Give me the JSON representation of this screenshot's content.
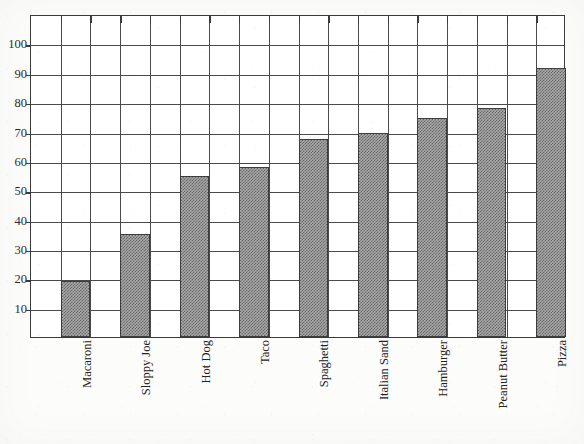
{
  "chart_data": {
    "type": "bar",
    "title": "",
    "xlabel": "",
    "ylabel": "",
    "ylim": [
      0,
      110
    ],
    "yticks": [
      10,
      20,
      30,
      40,
      50,
      60,
      70,
      80,
      90,
      100
    ],
    "ytick_labels": [
      "10",
      "20",
      "30",
      "40",
      "50",
      "60",
      "70",
      "80",
      "90",
      "100"
    ],
    "grid": true,
    "legend": "none",
    "categories": [
      "Macaroni",
      "Sloppy Joe",
      "Hot Dog",
      "Taco",
      "Spaghetti",
      "Italian Sand",
      "Hamburger",
      "Peanut Butter",
      "Pizza"
    ],
    "values": [
      19,
      35,
      55,
      58,
      67.5,
      69.5,
      74.5,
      78,
      91.5
    ],
    "bar_fill": "halftone-gray",
    "bar_color": "#a9a9a9",
    "bar_edge_color": "#3d3d3d",
    "axis_color": "#3a3a3a",
    "grid_color": "#4a4a4a",
    "background_color": "#fcfcfa"
  },
  "figure": {
    "title_remnant": "",
    "y_axis_name": "y-axis",
    "x_axis_name": "x-axis"
  }
}
